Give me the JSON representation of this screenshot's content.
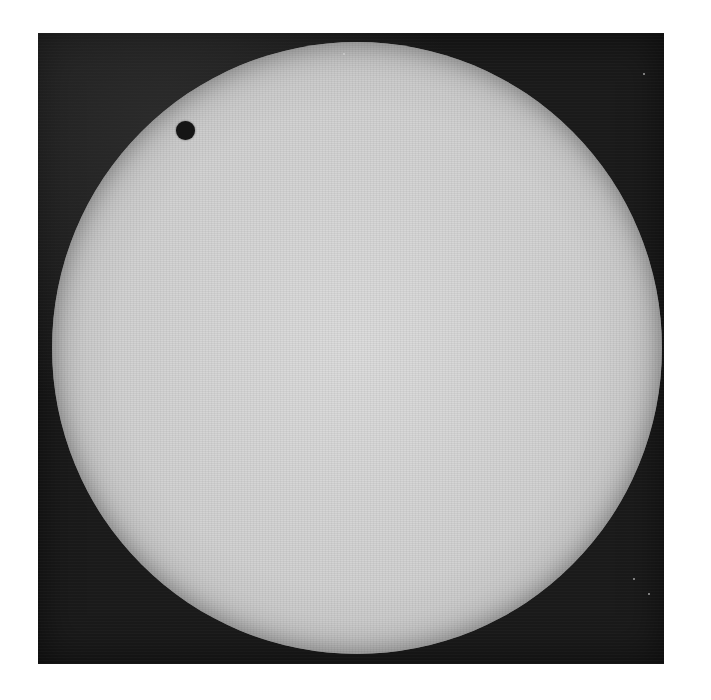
{
  "image": {
    "description": "Black-and-white telescopic photograph of the solar disc with a small dark circular silhouette near the upper-left limb",
    "colors": {
      "background": "#ffffff",
      "sky": "#1a1a1a",
      "disc_center": "#dcdcdc",
      "disc_limb": "#7a7a7a",
      "silhouette": "#151515"
    },
    "features": [
      {
        "name": "solar-disc",
        "shape": "circle",
        "approx_center": [
          357,
          348
        ],
        "approx_radius": 305
      },
      {
        "name": "dark-silhouette",
        "shape": "circle",
        "approx_center": [
          186,
          130
        ],
        "approx_radius": 9
      }
    ]
  }
}
